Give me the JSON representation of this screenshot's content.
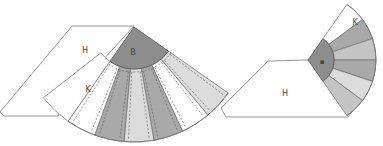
{
  "figure": {
    "colors": {
      "hub": "#8d8d8d",
      "dark": "#a9a9a9",
      "mid": "#c4c4c4",
      "light": "#dcdcdc",
      "white": "#ffffff",
      "outline": "#8a8a8a"
    },
    "left": {
      "labels": {
        "panel": "H",
        "hub": "B",
        "gore": "K"
      },
      "gore_shades": [
        "white",
        "dark",
        "light",
        "dark",
        "white",
        "light"
      ]
    },
    "right": {
      "labels": {
        "panel": "H",
        "hub": "▪",
        "gore": "K"
      },
      "gore_shades": [
        "white",
        "dark",
        "mid",
        "dark",
        "light",
        "mid"
      ]
    }
  }
}
